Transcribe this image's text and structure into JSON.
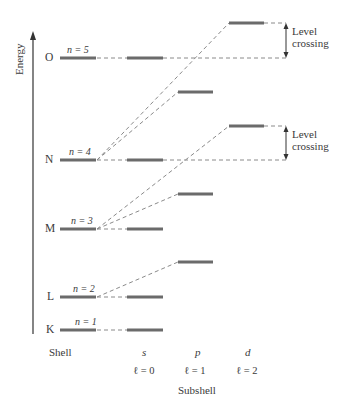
{
  "axis": {
    "y_label": "Energy",
    "x_labels": {
      "shell": "Shell",
      "subshell": "Subshell"
    }
  },
  "columns": [
    {
      "id": "shell",
      "label": "Shell"
    },
    {
      "id": "s",
      "symbol": "s",
      "l_label": "ℓ = 0"
    },
    {
      "id": "p",
      "symbol": "p",
      "l_label": "ℓ = 1"
    },
    {
      "id": "d",
      "symbol": "d",
      "l_label": "ℓ = 2"
    }
  ],
  "shells": [
    {
      "letter": "K",
      "n_label": "n = 1"
    },
    {
      "letter": "L",
      "n_label": "n = 2"
    },
    {
      "letter": "M",
      "n_label": "n = 3"
    },
    {
      "letter": "N",
      "n_label": "n = 4"
    },
    {
      "letter": "O",
      "n_label": "n = 5"
    }
  ],
  "annotations": [
    {
      "text_line1": "Level",
      "text_line2": "crossing",
      "between": "4d and 5s"
    },
    {
      "text_line1": "Level",
      "text_line2": "crossing",
      "between": "3d and 4s"
    }
  ],
  "colors": {
    "level": "#6b6b6b",
    "dash": "#8a8a8a",
    "axis": "#333333",
    "text": "#3a3a3a"
  }
}
